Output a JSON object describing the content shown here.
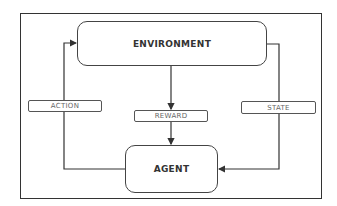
{
  "diagram": {
    "type": "reinforcement-learning-loop",
    "nodes": {
      "environment": "ENVIRONMENT",
      "agent": "AGENT"
    },
    "edges": {
      "action": "ACTION",
      "reward": "REWARD",
      "state": "STATE"
    },
    "connections": [
      {
        "from": "agent",
        "to": "environment",
        "label": "ACTION"
      },
      {
        "from": "environment",
        "to": "agent",
        "label": "REWARD"
      },
      {
        "from": "environment",
        "to": "agent",
        "label": "STATE"
      }
    ]
  },
  "colors": {
    "line": "#333333",
    "box_border": "#444444",
    "label_text": "#666666",
    "node_text": "#333333"
  }
}
